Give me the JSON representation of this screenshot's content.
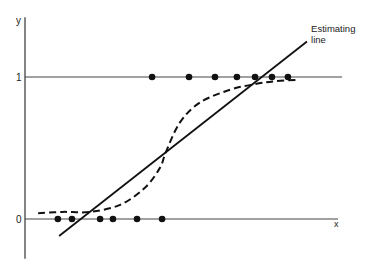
{
  "chart_data": {
    "type": "scatter",
    "title": "",
    "xlabel": "x",
    "ylabel": "y",
    "y_ticks": [
      {
        "value": 0,
        "label": "0"
      },
      {
        "value": 1,
        "label": "1"
      }
    ],
    "xlim": [
      0,
      10
    ],
    "ylim": [
      -0.28,
      1.42
    ],
    "grid": false,
    "reference_lines": [
      {
        "y": 0,
        "x_end": 10.0
      },
      {
        "y": 1,
        "x_end": 10.13
      }
    ],
    "series": [
      {
        "name": "observations y=1",
        "kind": "points",
        "x": [
          4.06,
          5.24,
          6.07,
          6.77,
          7.35,
          7.89,
          8.4
        ],
        "y": [
          1,
          1,
          1,
          1,
          1,
          1,
          1
        ]
      },
      {
        "name": "observations y=0",
        "kind": "points",
        "x": [
          1.05,
          1.5,
          2.4,
          2.81,
          3.58,
          4.38
        ],
        "y": [
          0,
          0,
          0,
          0,
          0,
          0
        ]
      },
      {
        "name": "Estimating line",
        "kind": "solid-line",
        "x": [
          1.09,
          9.01
        ],
        "y": [
          -0.12,
          1.25
        ]
      },
      {
        "name": "logistic curve",
        "kind": "dashed-curve",
        "x": [
          0.42,
          1.2,
          2.08,
          3.04,
          3.83,
          4.31,
          4.5,
          4.95,
          5.59,
          6.55,
          7.35,
          7.99,
          8.69
        ],
        "y": [
          0.04,
          0.05,
          0.05,
          0.1,
          0.22,
          0.36,
          0.47,
          0.68,
          0.82,
          0.91,
          0.95,
          0.97,
          0.98
        ]
      }
    ],
    "annotations": [
      {
        "text_lines": [
          "Estimating",
          "line"
        ],
        "x": 9.14,
        "y": 1.32
      }
    ]
  }
}
